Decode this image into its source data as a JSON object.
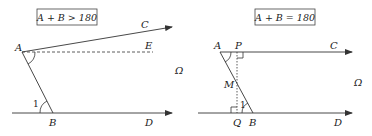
{
  "left_diagram": {
    "condition": "A + B > 180",
    "labels": {
      "A": "A",
      "B": "B",
      "C": "C",
      "D": "D",
      "E": "E",
      "omega": "Ω",
      "angle": "1"
    }
  },
  "right_diagram": {
    "condition": "A + B = 180",
    "labels": {
      "A": "A",
      "B": "B",
      "C": "C",
      "D": "D",
      "P": "P",
      "Q": "Q",
      "M": "M",
      "omega": "Ω",
      "angle": "1"
    }
  },
  "colors": {
    "stroke": "#333333",
    "text": "#222222"
  }
}
